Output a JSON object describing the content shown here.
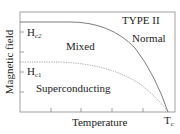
{
  "diagram": {
    "title": "TYPE II",
    "xlabel": "Temperature",
    "ylabel": "Magnetic field",
    "regions": {
      "normal": "Normal",
      "mixed": "Mixed",
      "superconducting": "Superconducting"
    },
    "curve_labels": {
      "hc2_main": "H",
      "hc2_sub": "c2",
      "hc1_main": "H",
      "hc1_sub": "c1",
      "tc_main": "T",
      "tc_sub": "c"
    },
    "colors": {
      "axis": "#8a8a8a",
      "curve": "#7a7a7a",
      "text": "#222222"
    }
  }
}
